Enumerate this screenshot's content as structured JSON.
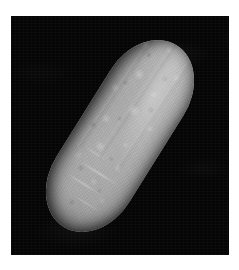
{
  "figure": {
    "kind": "photograph",
    "subject_label": "elongated oblong specimen",
    "caption": "",
    "orientation": "diagonal, upper-left to lower-right",
    "background_style": "black plate on white page"
  },
  "canvas": {
    "width_px": 239,
    "height_px": 270,
    "page_color": "#ffffff"
  },
  "plate": {
    "x_px": 11,
    "y_px": 16,
    "width_px": 218,
    "height_px": 239,
    "color": "#050505"
  },
  "specimen": {
    "name": "specimen",
    "shape": "capsule",
    "rotation_deg": 32,
    "length_px": 214,
    "width_px": 86,
    "body_color": "#a9a9a9",
    "highlight_color": "#d2d2d2",
    "shadow_color": "#3a3a3a",
    "surface_texture": "mottled warty skin with faint longitudinal ridges and bright creases"
  },
  "colors": {
    "page": "#ffffff",
    "plate": "#050505",
    "specimen_mid": "#a9a9a9",
    "specimen_light": "#d2d2d2",
    "specimen_dark": "#3a3a3a"
  }
}
